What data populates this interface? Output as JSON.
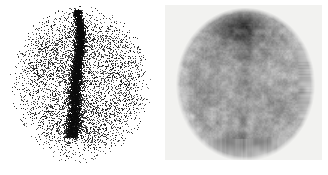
{
  "figure": {
    "panel_count": 2,
    "width_px": 328,
    "height_px": 175,
    "background_color": "#ffffff"
  },
  "panels": [
    {
      "id": "left",
      "name": "sparse-count-scan",
      "label": "",
      "render_mode": "dot-density",
      "background_color": "#ffffff",
      "plate": null,
      "blob": {
        "center_x": 81,
        "center_y": 84,
        "radius_x": 67,
        "radius_y": 76,
        "edge_softness": 0.34
      },
      "midline_band": {
        "present": true,
        "top_x": 77,
        "bottom_x": 74,
        "top_y": 10,
        "bottom_y": 138,
        "width": 10,
        "intensity": 0.95,
        "color": "#101010",
        "description": "dense vertical midline uptake band"
      },
      "lower_focus": {
        "present": true,
        "center_x": 78,
        "center_y": 122,
        "radius_x": 24,
        "radius_y": 20,
        "intensity": 0.62
      },
      "dot_color": "#1a1a1a",
      "dot_count": 26000,
      "dot_size_px": 1
    },
    {
      "id": "right",
      "name": "smoothed-grayscale-scan",
      "label": "",
      "render_mode": "smooth-grayscale",
      "background_color": "#f2f2f0",
      "plate": {
        "x": 1,
        "y": 5,
        "width": 157,
        "height": 155,
        "color": "#f2f2f0"
      },
      "blob": {
        "center_x": 80,
        "center_y": 79,
        "radius_x": 67,
        "radius_y": 74,
        "edge_softness": 0.1
      },
      "superior_band": {
        "present": true,
        "center_x": 74,
        "center_y": 22,
        "radius_x": 40,
        "radius_y": 26,
        "intensity": 0.8,
        "color": "#2a2a2a",
        "description": "dark superior / vertex uptake band"
      },
      "midline_band": {
        "present": true,
        "top_x": 78,
        "bottom_x": 76,
        "top_y": 10,
        "bottom_y": 120,
        "width": 7,
        "intensity": 0.22
      },
      "base_gray": "#9a9a9a",
      "noise_amplitude": 0.17,
      "mottle_scale_px": 9
    }
  ],
  "colors": {
    "page_background": "#ffffff",
    "plate_background": "#f2f2f0",
    "ink": "#1a1a1a",
    "mid_gray": "#9a9a9a"
  }
}
